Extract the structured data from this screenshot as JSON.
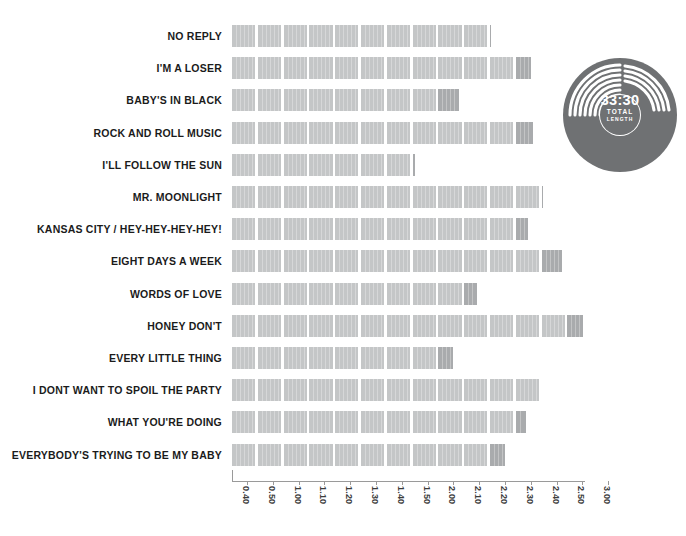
{
  "chart_data": {
    "type": "bar",
    "orientation": "horizontal",
    "title": "",
    "xlabel": "",
    "ylabel": "",
    "unit": "minutes:seconds (track length)",
    "xlim": [
      0.35,
      3.05
    ],
    "grid": false,
    "legend": false,
    "segment_step": 0.1,
    "categories": [
      "NO REPLY",
      "I'M A LOSER",
      "BABY'S IN BLACK",
      "ROCK AND ROLL MUSIC",
      "I'LL FOLLOW THE SUN",
      "MR. MOONLIGHT",
      "KANSAS CITY / HEY-HEY-HEY-HEY!",
      "EIGHT DAYS A WEEK",
      "WORDS OF LOVE",
      "HONEY DON'T",
      "EVERY LITTLE THING",
      "I DONT WANT TO SPOIL THE PARTY",
      "WHAT YOU'RE DOING",
      "EVERYBODY'S TRYING TO BE MY BABY"
    ],
    "values": [
      2.15,
      2.31,
      2.03,
      2.32,
      1.46,
      2.35,
      2.3,
      2.43,
      2.1,
      2.56,
      2.01,
      2.34,
      2.29,
      2.21
    ],
    "value_labels": [
      "2:15",
      "2:31",
      "2:03",
      "2:32",
      "1:46",
      "2:35",
      "2:30",
      "2:43",
      "2:10",
      "2:56",
      "2:01",
      "2:34",
      "2:29",
      "2:21"
    ],
    "xticks": [
      0.4,
      0.5,
      1.0,
      1.1,
      1.2,
      1.3,
      1.4,
      1.5,
      2.0,
      2.1,
      2.2,
      2.3,
      2.4,
      2.5,
      3.0
    ],
    "xticklabels": [
      "0.40",
      "0.50",
      "1.00",
      "1.10",
      "1.20",
      "1.30",
      "1.40",
      "1.50",
      "2.00",
      "2.10",
      "2.20",
      "2.30",
      "2.40",
      "2.50",
      "3.00"
    ],
    "bar_color": "#c4c6c7",
    "bar_tail_color": "#a9abad"
  },
  "vinyl": {
    "total_length": "33:30",
    "caption_line1": "TOTAL",
    "caption_line2": "LENGTH",
    "disc_color": "#6f7173",
    "groove_color": "#ffffff"
  },
  "colors": {
    "bar": "#c4c6c7",
    "bar_tail": "#a9abad",
    "axis": "#9a9a9a",
    "label_text": "#1b1b1b",
    "tick_text": "#3c3c3c",
    "background": "#ffffff"
  }
}
